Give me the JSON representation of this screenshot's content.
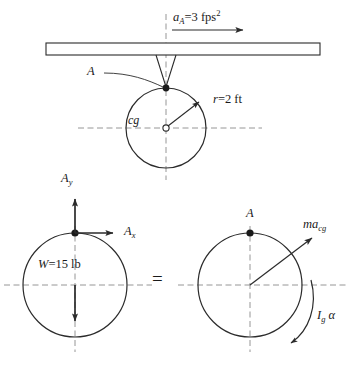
{
  "figure": {
    "colors": {
      "stroke": "#2b2b2b",
      "dashed": "#8a8a8a",
      "background": "#ffffff",
      "text": "#1a1a1a"
    }
  },
  "top_diagram": {
    "acceleration_label": {
      "symbol": "a",
      "subscript": "A",
      "equals": "=",
      "value": "3",
      "unit": "fps",
      "unit_exponent": "2",
      "full_text": "a_A = 3 fps2"
    },
    "contact_point_label": "A",
    "center_label": "cg",
    "radius_label": {
      "symbol": "r",
      "equals": "=",
      "value": "2",
      "unit": "ft",
      "full_text": "r = 2 ft"
    }
  },
  "left_fbd": {
    "reaction_vertical": {
      "symbol": "A",
      "subscript": "y",
      "full_text": "A_y"
    },
    "reaction_horizontal": {
      "symbol": "A",
      "subscript": "x",
      "full_text": "A_x"
    },
    "weight_label": {
      "symbol": "W",
      "equals": "=",
      "value": "15",
      "unit": "lb",
      "full_text": "W = 15 lb"
    }
  },
  "equality": {
    "sign": "="
  },
  "right_fbd": {
    "point_label": "A",
    "inertia_force": {
      "symbol": "ma",
      "subscript": "cg",
      "full_text": "ma_cg"
    },
    "inertia_couple": {
      "symbol": "I",
      "subscript": "g",
      "alpha": "α",
      "full_text": "I_g α"
    }
  }
}
